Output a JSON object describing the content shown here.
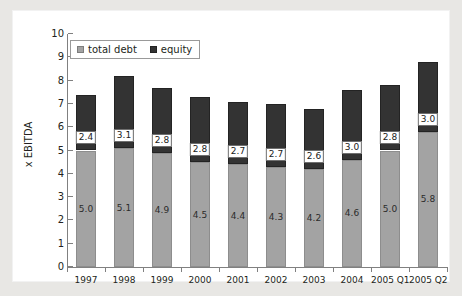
{
  "chart_data": {
    "type": "bar",
    "stacked": true,
    "title": "",
    "xlabel": "",
    "ylabel": "x EBITDA",
    "ylim": [
      0,
      10
    ],
    "ytick_labels": [
      "10",
      "9",
      "8",
      "7",
      "6",
      "5",
      "4",
      "3",
      "2",
      "1",
      "0"
    ],
    "ytick_values": [
      10,
      9,
      8,
      7,
      6,
      5,
      4,
      3,
      2,
      1,
      0
    ],
    "grid": false,
    "legend_position": "top-left",
    "categories": [
      "1997",
      "1998",
      "1999",
      "2000",
      "2001",
      "2002",
      "2003",
      "2004",
      "2005 Q1",
      "2005 Q2"
    ],
    "series": [
      {
        "name": "total debt",
        "color": "#a3a3a3",
        "values": [
          5.0,
          5.1,
          4.9,
          4.5,
          4.4,
          4.3,
          4.2,
          4.6,
          5.0,
          5.8
        ],
        "labels": [
          "5.0",
          "5.1",
          "4.9",
          "4.5",
          "4.4",
          "4.3",
          "4.2",
          "4.6",
          "5.0",
          "5.8"
        ]
      },
      {
        "name": "equity",
        "color": "#333333",
        "values": [
          2.4,
          3.1,
          2.8,
          2.8,
          2.7,
          2.7,
          2.6,
          3.0,
          2.8,
          3.0
        ],
        "labels": [
          "2.4",
          "3.1",
          "2.8",
          "2.8",
          "2.7",
          "2.7",
          "2.6",
          "3.0",
          "2.8",
          "3.0"
        ]
      }
    ],
    "totals": [
      7.4,
      8.2,
      7.7,
      7.3,
      7.1,
      7.0,
      6.8,
      7.6,
      7.8,
      8.8
    ]
  },
  "legend": {
    "items": [
      {
        "label": "total debt",
        "swatch": "swatch-debt"
      },
      {
        "label": "equity",
        "swatch": "swatch-equity"
      }
    ]
  },
  "axis": {
    "y_title": "x EBITDA"
  }
}
